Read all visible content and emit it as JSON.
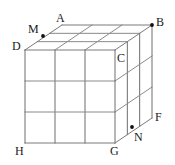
{
  "figure": {
    "name": "labeled-cube-grid-diagram",
    "width": 175,
    "height": 165,
    "background_color": "#ffffff"
  },
  "style": {
    "edge_color": "#8a8a8a",
    "vertical_edge_color": "#6e6e6e",
    "outline_color": "#7a7a7a",
    "point_color": "#101010",
    "label_color": "#1a1a1a",
    "edge_width": 1,
    "divisions": 3
  },
  "geometry": {
    "front_face": {
      "left": 25,
      "top": 50,
      "right": 115,
      "bottom": 143
    },
    "depth_offset": {
      "dx": 37,
      "dy": -25
    }
  },
  "labels": [
    {
      "id": "A",
      "text": "A",
      "x": 56,
      "y": 12,
      "role": "top-back-vertex-label"
    },
    {
      "id": "B",
      "text": "B",
      "x": 156,
      "y": 16,
      "role": "top-back-right-vertex-label"
    },
    {
      "id": "C",
      "text": "C",
      "x": 117,
      "y": 52,
      "role": "top-front-right-vertex-label"
    },
    {
      "id": "D",
      "text": "D",
      "x": 12,
      "y": 40,
      "role": "top-front-left-vertex-label"
    },
    {
      "id": "F",
      "text": "F",
      "x": 155,
      "y": 111,
      "role": "bottom-back-right-vertex-label"
    },
    {
      "id": "G",
      "text": "G",
      "x": 110,
      "y": 145,
      "role": "bottom-front-right-vertex-label"
    },
    {
      "id": "H",
      "text": "H",
      "x": 15,
      "y": 145,
      "role": "bottom-front-left-vertex-label"
    },
    {
      "id": "M",
      "text": "M",
      "x": 28,
      "y": 23,
      "role": "marked-point-label-top"
    },
    {
      "id": "N",
      "text": "N",
      "x": 134,
      "y": 131,
      "role": "marked-point-label-bottom"
    }
  ],
  "points": [
    {
      "id": "M",
      "x": 43,
      "y": 36,
      "role": "point-on-top-back-edge"
    },
    {
      "id": "B",
      "x": 152,
      "y": 25,
      "role": "cube-corner-dot"
    },
    {
      "id": "N",
      "x": 132,
      "y": 127,
      "role": "point-on-bottom-right-edge"
    }
  ]
}
